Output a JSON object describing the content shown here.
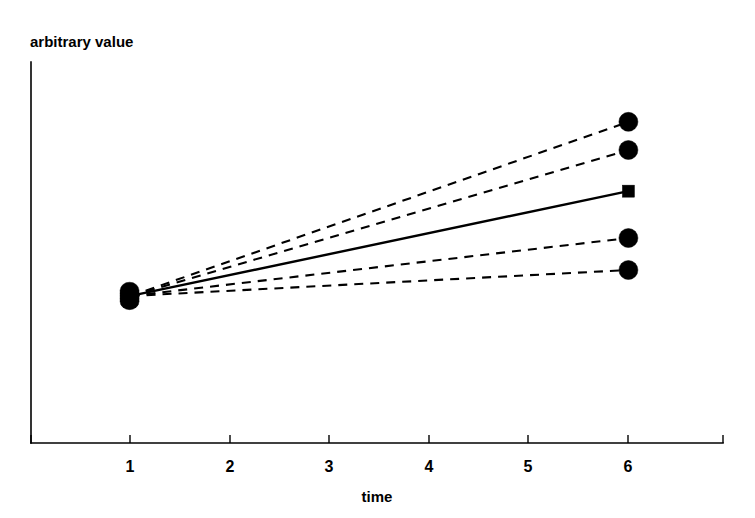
{
  "chart_data": {
    "type": "line",
    "title": "",
    "xlabel": "time",
    "ylabel": "arbitrary value",
    "xlim": [
      0.0,
      6.95
    ],
    "ylim": [
      0.0,
      1.0
    ],
    "x_ticks": [
      1,
      2,
      3,
      4,
      5,
      6
    ],
    "x_tick_labels": [
      "1",
      "2",
      "3",
      "4",
      "5",
      "6"
    ],
    "y_ticks": [],
    "y_tick_labels": [],
    "grid": false,
    "legend": null,
    "axis_style": "open-left-bottom-spines",
    "x": [
      1,
      6
    ],
    "series": [
      {
        "name": "series-1-top",
        "style": "dashed",
        "marker": "circle",
        "values": [
          0.386,
          0.843
        ]
      },
      {
        "name": "series-2-upper",
        "style": "dashed",
        "marker": "circle",
        "values": [
          0.386,
          0.769
        ]
      },
      {
        "name": "series-3-mean",
        "style": "solid",
        "marker": "square",
        "values": [
          0.386,
          0.661
        ]
      },
      {
        "name": "series-4-lower",
        "style": "dashed",
        "marker": "circle",
        "values": [
          0.386,
          0.538
        ]
      },
      {
        "name": "series-5-bottom",
        "style": "dashed",
        "marker": "circle",
        "values": [
          0.386,
          0.454
        ]
      }
    ],
    "annotations": [
      {
        "name": "origin-cluster",
        "text": "",
        "note": "all five series share a single overlapping marker cluster at time = 1"
      }
    ]
  },
  "labels": {
    "y_axis_title": "arbitrary value",
    "x_axis_title": "time"
  },
  "colors": {
    "ink": "#000000",
    "background": "#ffffff"
  }
}
